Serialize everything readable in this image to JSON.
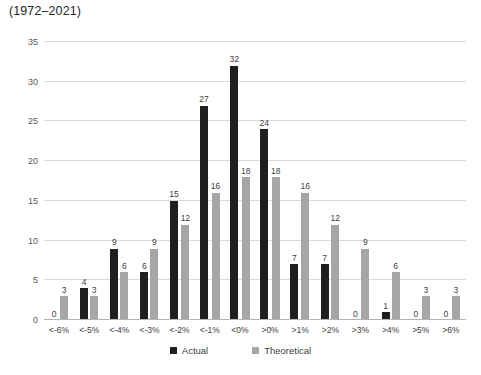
{
  "header": {
    "title_line": "(1972–2021)"
  },
  "chart_data": {
    "type": "bar",
    "title": "(1972–2021)",
    "categories": [
      "<-6%",
      "<-5%",
      "<-4%",
      "<-3%",
      "<-2%",
      "<-1%",
      "<0%",
      ">0%",
      ">1%",
      ">2%",
      ">3%",
      ">4%",
      ">5%",
      ">6%"
    ],
    "series": [
      {
        "name": "Actual",
        "color": "#1f1f1f",
        "values": [
          0,
          4,
          9,
          6,
          15,
          27,
          32,
          24,
          7,
          7,
          0,
          1,
          0,
          0
        ]
      },
      {
        "name": "Theoretical",
        "color": "#a6a6a6",
        "values": [
          3,
          3,
          6,
          9,
          12,
          16,
          18,
          18,
          16,
          12,
          9,
          6,
          3,
          3
        ]
      }
    ],
    "xlabel": "",
    "ylabel": "",
    "ylim": [
      0,
      35
    ],
    "ytick_step": 5,
    "grid": true,
    "show_data_labels": true,
    "legend_position": "bottom"
  },
  "colors": {
    "gridline": "#d9d9d9",
    "baseline": "#b3b3b3",
    "axis_text": "#595959",
    "label_text": "#404040",
    "background": "#ffffff"
  }
}
